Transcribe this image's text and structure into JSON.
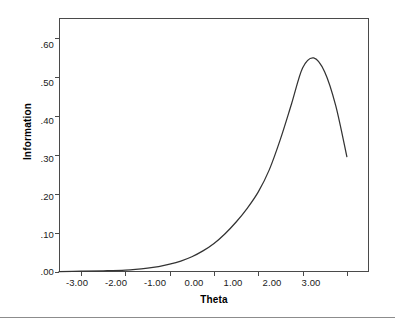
{
  "chart_data": {
    "type": "line",
    "title": "",
    "subtitle": "",
    "xlabel": "Theta",
    "ylabel": "Information",
    "xlim": [
      -3.5,
      3.5
    ],
    "ylim": [
      0.0,
      0.65
    ],
    "grid": false,
    "legend": null,
    "x_tick_labels": [
      "-3.00",
      "-2.00",
      "-1.00",
      "0.00",
      "1.00",
      "2.00",
      "3.00"
    ],
    "x_tick_values": [
      -3,
      -2,
      -1,
      0,
      1,
      2,
      3
    ],
    "y_tick_labels": [
      ".00",
      ".10",
      ".20",
      ".30",
      ".40",
      ".50",
      ".60"
    ],
    "y_tick_values": [
      0.0,
      0.1,
      0.2,
      0.3,
      0.4,
      0.5,
      0.6
    ],
    "series": [
      {
        "name": "Item information",
        "color": "#333333",
        "x": [
          -3.5,
          -3.0,
          -2.5,
          -2.0,
          -1.5,
          -1.25,
          -1.0,
          -0.75,
          -0.5,
          -0.25,
          0.0,
          0.25,
          0.5,
          0.75,
          1.0,
          1.25,
          1.5,
          1.75,
          2.0,
          2.25,
          2.5,
          2.75,
          3.0
        ],
        "values": [
          0.001,
          0.002,
          0.003,
          0.005,
          0.01,
          0.014,
          0.02,
          0.028,
          0.039,
          0.054,
          0.073,
          0.098,
          0.128,
          0.163,
          0.205,
          0.262,
          0.34,
          0.43,
          0.522,
          0.548,
          0.512,
          0.425,
          0.295
        ]
      }
    ],
    "annotations": {
      "peak_theta": "2.00",
      "peak_information": ".55",
      "endpoint_theta": "3.00",
      "endpoint_information": ".30"
    }
  },
  "axes": {
    "x_title": "Theta",
    "y_title": "Information"
  }
}
